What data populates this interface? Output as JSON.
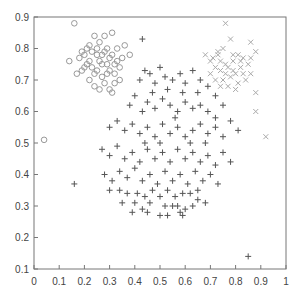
{
  "chart_data": {
    "type": "scatter",
    "title": "",
    "xlabel": "",
    "ylabel": "",
    "xlim": [
      0,
      1
    ],
    "ylim": [
      0.1,
      0.9
    ],
    "grid": false,
    "legend": null,
    "x_ticks": [
      "0",
      "0.1",
      "0.2",
      "0.3",
      "0.4",
      "0.5",
      "0.6",
      "0.7",
      "0.8",
      "0.9",
      "1"
    ],
    "y_ticks": [
      "0.1",
      "0.2",
      "0.3",
      "0.4",
      "0.5",
      "0.6",
      "0.7",
      "0.8",
      "0.9"
    ],
    "series": [
      {
        "name": "cluster-circles",
        "marker": "circle",
        "color": "#999999",
        "points": [
          [
            0.16,
            0.88
          ],
          [
            0.04,
            0.51
          ],
          [
            0.14,
            0.76
          ],
          [
            0.17,
            0.72
          ],
          [
            0.19,
            0.73
          ],
          [
            0.2,
            0.78
          ],
          [
            0.21,
            0.8
          ],
          [
            0.22,
            0.76
          ],
          [
            0.23,
            0.74
          ],
          [
            0.24,
            0.84
          ],
          [
            0.25,
            0.78
          ],
          [
            0.26,
            0.82
          ],
          [
            0.27,
            0.75
          ],
          [
            0.28,
            0.79
          ],
          [
            0.29,
            0.72
          ],
          [
            0.3,
            0.77
          ],
          [
            0.31,
            0.85
          ],
          [
            0.32,
            0.75
          ],
          [
            0.33,
            0.8
          ],
          [
            0.34,
            0.7
          ],
          [
            0.22,
            0.7
          ],
          [
            0.24,
            0.68
          ],
          [
            0.26,
            0.67
          ],
          [
            0.28,
            0.69
          ],
          [
            0.3,
            0.67
          ],
          [
            0.32,
            0.72
          ],
          [
            0.25,
            0.73
          ],
          [
            0.27,
            0.71
          ],
          [
            0.23,
            0.79
          ],
          [
            0.21,
            0.75
          ],
          [
            0.19,
            0.79
          ],
          [
            0.29,
            0.8
          ],
          [
            0.31,
            0.78
          ],
          [
            0.33,
            0.76
          ],
          [
            0.35,
            0.77
          ],
          [
            0.36,
            0.81
          ],
          [
            0.38,
            0.78
          ],
          [
            0.28,
            0.84
          ],
          [
            0.26,
            0.76
          ],
          [
            0.24,
            0.72
          ],
          [
            0.2,
            0.74
          ],
          [
            0.18,
            0.77
          ],
          [
            0.3,
            0.73
          ],
          [
            0.32,
            0.69
          ],
          [
            0.34,
            0.74
          ],
          [
            0.31,
            0.66
          ],
          [
            0.22,
            0.81
          ],
          [
            0.27,
            0.78
          ],
          [
            0.25,
            0.8
          ],
          [
            0.29,
            0.75
          ]
        ]
      },
      {
        "name": "cluster-crosses",
        "marker": "x",
        "color": "#aaaaaa",
        "points": [
          [
            0.76,
            0.88
          ],
          [
            0.78,
            0.83
          ],
          [
            0.73,
            0.79
          ],
          [
            0.75,
            0.8
          ],
          [
            0.79,
            0.76
          ],
          [
            0.81,
            0.78
          ],
          [
            0.83,
            0.77
          ],
          [
            0.85,
            0.75
          ],
          [
            0.7,
            0.76
          ],
          [
            0.72,
            0.74
          ],
          [
            0.74,
            0.73
          ],
          [
            0.76,
            0.75
          ],
          [
            0.78,
            0.71
          ],
          [
            0.8,
            0.72
          ],
          [
            0.82,
            0.74
          ],
          [
            0.84,
            0.7
          ],
          [
            0.86,
            0.72
          ],
          [
            0.68,
            0.78
          ],
          [
            0.71,
            0.77
          ],
          [
            0.74,
            0.76
          ],
          [
            0.77,
            0.74
          ],
          [
            0.79,
            0.73
          ],
          [
            0.81,
            0.69
          ],
          [
            0.83,
            0.72
          ],
          [
            0.86,
            0.77
          ],
          [
            0.88,
            0.79
          ],
          [
            0.72,
            0.7
          ],
          [
            0.75,
            0.7
          ],
          [
            0.77,
            0.68
          ],
          [
            0.8,
            0.67
          ],
          [
            0.88,
            0.66
          ],
          [
            0.88,
            0.6
          ],
          [
            0.92,
            0.52
          ],
          [
            0.86,
            0.82
          ],
          [
            0.73,
            0.78
          ],
          [
            0.76,
            0.72
          ],
          [
            0.79,
            0.78
          ],
          [
            0.82,
            0.76
          ],
          [
            0.7,
            0.72
          ],
          [
            0.74,
            0.68
          ]
        ]
      },
      {
        "name": "cluster-plus",
        "marker": "plus",
        "color": "#555555",
        "points": [
          [
            0.43,
            0.83
          ],
          [
            0.16,
            0.37
          ],
          [
            0.85,
            0.14
          ],
          [
            0.42,
            0.7
          ],
          [
            0.44,
            0.73
          ],
          [
            0.46,
            0.72
          ],
          [
            0.48,
            0.69
          ],
          [
            0.5,
            0.74
          ],
          [
            0.52,
            0.71
          ],
          [
            0.55,
            0.7
          ],
          [
            0.58,
            0.72
          ],
          [
            0.6,
            0.69
          ],
          [
            0.63,
            0.73
          ],
          [
            0.66,
            0.7
          ],
          [
            0.69,
            0.68
          ],
          [
            0.72,
            0.65
          ],
          [
            0.38,
            0.62
          ],
          [
            0.4,
            0.65
          ],
          [
            0.43,
            0.6
          ],
          [
            0.45,
            0.63
          ],
          [
            0.48,
            0.61
          ],
          [
            0.51,
            0.64
          ],
          [
            0.54,
            0.62
          ],
          [
            0.57,
            0.6
          ],
          [
            0.6,
            0.63
          ],
          [
            0.63,
            0.61
          ],
          [
            0.66,
            0.62
          ],
          [
            0.69,
            0.6
          ],
          [
            0.72,
            0.58
          ],
          [
            0.75,
            0.62
          ],
          [
            0.3,
            0.55
          ],
          [
            0.33,
            0.57
          ],
          [
            0.36,
            0.54
          ],
          [
            0.39,
            0.56
          ],
          [
            0.42,
            0.53
          ],
          [
            0.45,
            0.55
          ],
          [
            0.48,
            0.52
          ],
          [
            0.51,
            0.56
          ],
          [
            0.54,
            0.53
          ],
          [
            0.57,
            0.55
          ],
          [
            0.6,
            0.52
          ],
          [
            0.63,
            0.54
          ],
          [
            0.66,
            0.56
          ],
          [
            0.69,
            0.53
          ],
          [
            0.72,
            0.55
          ],
          [
            0.75,
            0.52
          ],
          [
            0.78,
            0.57
          ],
          [
            0.81,
            0.54
          ],
          [
            0.27,
            0.48
          ],
          [
            0.3,
            0.46
          ],
          [
            0.33,
            0.49
          ],
          [
            0.36,
            0.45
          ],
          [
            0.39,
            0.47
          ],
          [
            0.42,
            0.44
          ],
          [
            0.45,
            0.48
          ],
          [
            0.48,
            0.45
          ],
          [
            0.51,
            0.47
          ],
          [
            0.54,
            0.44
          ],
          [
            0.57,
            0.48
          ],
          [
            0.6,
            0.45
          ],
          [
            0.63,
            0.47
          ],
          [
            0.66,
            0.44
          ],
          [
            0.69,
            0.46
          ],
          [
            0.72,
            0.43
          ],
          [
            0.75,
            0.47
          ],
          [
            0.78,
            0.44
          ],
          [
            0.28,
            0.4
          ],
          [
            0.31,
            0.38
          ],
          [
            0.34,
            0.41
          ],
          [
            0.37,
            0.39
          ],
          [
            0.4,
            0.42
          ],
          [
            0.43,
            0.38
          ],
          [
            0.46,
            0.4
          ],
          [
            0.49,
            0.37
          ],
          [
            0.52,
            0.41
          ],
          [
            0.55,
            0.38
          ],
          [
            0.58,
            0.4
          ],
          [
            0.61,
            0.37
          ],
          [
            0.64,
            0.41
          ],
          [
            0.67,
            0.38
          ],
          [
            0.7,
            0.4
          ],
          [
            0.73,
            0.37
          ],
          [
            0.35,
            0.31
          ],
          [
            0.39,
            0.28
          ],
          [
            0.4,
            0.31
          ],
          [
            0.43,
            0.29
          ],
          [
            0.45,
            0.28
          ],
          [
            0.46,
            0.31
          ],
          [
            0.5,
            0.27
          ],
          [
            0.52,
            0.3
          ],
          [
            0.53,
            0.27
          ],
          [
            0.55,
            0.3
          ],
          [
            0.57,
            0.3
          ],
          [
            0.58,
            0.28
          ],
          [
            0.59,
            0.27
          ],
          [
            0.6,
            0.29
          ],
          [
            0.63,
            0.3
          ],
          [
            0.65,
            0.32
          ],
          [
            0.68,
            0.31
          ],
          [
            0.3,
            0.35
          ],
          [
            0.34,
            0.35
          ],
          [
            0.37,
            0.34
          ],
          [
            0.41,
            0.34
          ],
          [
            0.44,
            0.33
          ],
          [
            0.47,
            0.35
          ],
          [
            0.5,
            0.33
          ],
          [
            0.53,
            0.35
          ],
          [
            0.56,
            0.33
          ],
          [
            0.59,
            0.34
          ],
          [
            0.62,
            0.34
          ],
          [
            0.65,
            0.35
          ],
          [
            0.47,
            0.66
          ],
          [
            0.53,
            0.67
          ],
          [
            0.59,
            0.66
          ],
          [
            0.65,
            0.66
          ],
          [
            0.56,
            0.58
          ],
          [
            0.5,
            0.5
          ],
          [
            0.44,
            0.5
          ],
          [
            0.62,
            0.5
          ],
          [
            0.68,
            0.5
          ]
        ]
      }
    ]
  }
}
